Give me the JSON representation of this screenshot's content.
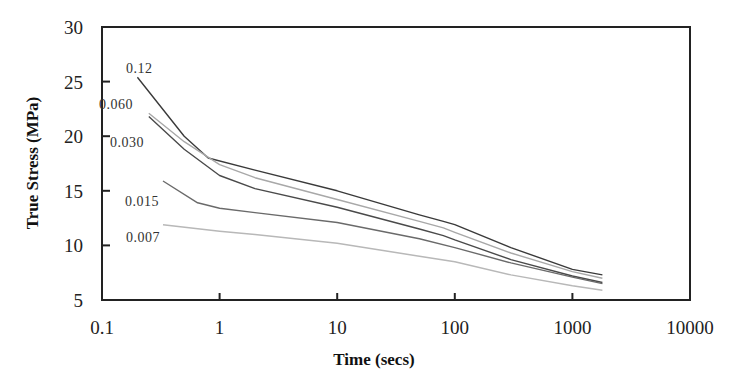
{
  "chart_data": {
    "type": "line",
    "title": "",
    "xlabel": "Time (secs)",
    "ylabel": "True Stress (MPa)",
    "xscale": "log",
    "xlim": [
      0.1,
      10000
    ],
    "ylim": [
      5,
      30
    ],
    "xticks": [
      "0.1",
      "1",
      "10",
      "100",
      "1000",
      "10000"
    ],
    "yticks": [
      "5",
      "10",
      "15",
      "20",
      "25",
      "30"
    ],
    "grid": false,
    "legend": "inline labels at curve starts",
    "series": [
      {
        "name": "0.12",
        "color": "#3a3a3a",
        "x": [
          0.2,
          0.5,
          0.8,
          2,
          10,
          50,
          80,
          100,
          300,
          1000,
          1800
        ],
        "y": [
          25.4,
          20.0,
          18.0,
          16.9,
          15.0,
          12.8,
          12.2,
          11.9,
          9.8,
          7.8,
          7.3
        ]
      },
      {
        "name": "0.060",
        "color": "#a8a8a8",
        "x": [
          0.25,
          0.5,
          1,
          2,
          10,
          50,
          80,
          100,
          300,
          1000,
          1800
        ],
        "y": [
          22.1,
          19.5,
          17.4,
          16.2,
          14.2,
          12.2,
          11.6,
          11.2,
          9.3,
          7.6,
          7.0
        ]
      },
      {
        "name": "0.030",
        "color": "#4a4a4a",
        "x": [
          0.25,
          0.5,
          1,
          2,
          10,
          50,
          80,
          100,
          300,
          1000,
          1800
        ],
        "y": [
          21.8,
          18.8,
          16.4,
          15.2,
          13.5,
          11.5,
          10.9,
          10.5,
          8.7,
          7.2,
          6.6
        ]
      },
      {
        "name": "0.015",
        "color": "#6a6a6a",
        "x": [
          0.33,
          0.65,
          1,
          2,
          10,
          50,
          100,
          300,
          1000,
          1800
        ],
        "y": [
          15.9,
          13.9,
          13.4,
          13.0,
          12.1,
          10.6,
          9.8,
          8.4,
          7.1,
          6.5
        ]
      },
      {
        "name": "0.007",
        "color": "#b8b8b8",
        "x": [
          0.33,
          1,
          2,
          10,
          50,
          100,
          300,
          1000,
          1800
        ],
        "y": [
          11.9,
          11.3,
          11.0,
          10.2,
          9.0,
          8.5,
          7.3,
          6.3,
          5.9
        ]
      }
    ]
  },
  "labels": {
    "xlabel": "Time (secs)",
    "ylabel": "True Stress (MPa)",
    "series_labels": [
      "0.12",
      "0.060",
      "0.030",
      "0.015",
      "0.007"
    ],
    "xticks": [
      "0.1",
      "1",
      "10",
      "100",
      "1000",
      "10000"
    ],
    "yticks": [
      "5",
      "10",
      "15",
      "20",
      "25",
      "30"
    ]
  }
}
